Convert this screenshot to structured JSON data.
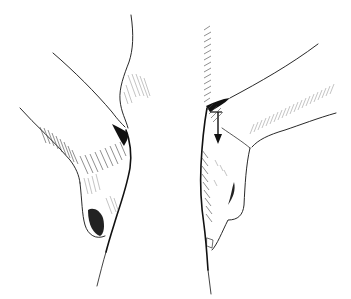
{
  "illustration": {
    "subject": "two hand and wrist line drawings",
    "colors": {
      "ink": "#111111",
      "shade": "#444444",
      "light_shade": "#888888",
      "background": "#ffffff"
    },
    "figures": [
      {
        "name": "left-hand",
        "description": "hand bent at wrist, side view"
      },
      {
        "name": "right-hand",
        "description": "hand bent at wrist with downward arrow"
      }
    ],
    "annotations": [
      {
        "type": "arrow",
        "direction": "down",
        "figure": "right-hand"
      }
    ]
  }
}
